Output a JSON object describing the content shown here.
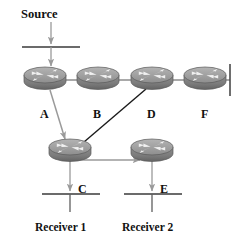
{
  "diagram": {
    "colors": {
      "router_body": "#8a8a8a",
      "router_top": "#a8a8a8",
      "router_bottom": "#6d6d6d",
      "router_outline": "#5d5d5d",
      "router_glyph": "#efefef",
      "link": "#888888",
      "arrow_gray": "#9a9a9a",
      "line_dark": "#1a1a1a",
      "segment": "#3a3a3a",
      "text": "#111111",
      "background": "#ffffff"
    },
    "source": {
      "label": "Source"
    },
    "routers": [
      {
        "id": "A",
        "label": "A",
        "cx": 45,
        "cy": 78
      },
      {
        "id": "B",
        "label": "B",
        "cx": 98,
        "cy": 78
      },
      {
        "id": "D",
        "label": "D",
        "cx": 152,
        "cy": 78
      },
      {
        "id": "F",
        "label": "F",
        "cx": 205,
        "cy": 78
      },
      {
        "id": "C",
        "label": "C",
        "cx": 70,
        "cy": 150
      },
      {
        "id": "E",
        "label": "E",
        "cx": 152,
        "cy": 150
      }
    ],
    "router_labels": [
      {
        "text": "A",
        "x": 40,
        "y": 108
      },
      {
        "text": "B",
        "x": 93,
        "y": 108
      },
      {
        "text": "D",
        "x": 147,
        "y": 108
      },
      {
        "text": "F",
        "x": 201,
        "y": 108
      },
      {
        "text": "C",
        "x": 78,
        "y": 196
      },
      {
        "text": "E",
        "x": 160,
        "y": 196
      }
    ],
    "receivers": [
      {
        "label": "Receiver 1",
        "x": 35,
        "y": 224
      },
      {
        "label": "Receiver 2",
        "x": 122,
        "y": 224
      }
    ],
    "links": [
      {
        "from": "A",
        "to": "B",
        "style": "backbone"
      },
      {
        "from": "B",
        "to": "D",
        "style": "backbone"
      },
      {
        "from": "D",
        "to": "F",
        "style": "backbone"
      },
      {
        "from": "F",
        "to": "terminator",
        "style": "backbone"
      },
      {
        "from": "Source",
        "to": "A",
        "style": "arrow-gray"
      },
      {
        "from": "A",
        "to": "C",
        "style": "arrow-gray"
      },
      {
        "from": "D",
        "to": "C",
        "style": "line-dark"
      },
      {
        "from": "C",
        "to": "E",
        "style": "arrow-gray"
      },
      {
        "from": "C",
        "to": "Receiver 1",
        "style": "arrow-gray"
      },
      {
        "from": "E",
        "to": "Receiver 2",
        "style": "arrow-gray"
      }
    ]
  }
}
